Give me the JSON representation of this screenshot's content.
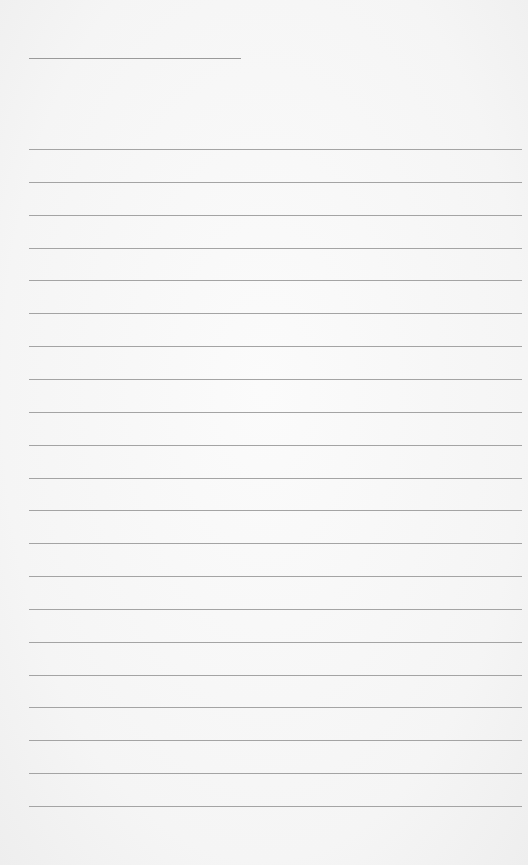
{
  "page": {
    "type": "lined-paper",
    "background_color": "#f6f6f6",
    "line_color": "#a4a4a4"
  },
  "title_line": {
    "left": 29,
    "top": 58,
    "width": 212
  },
  "ruled_lines": {
    "count": 21,
    "left": 29,
    "width": 493,
    "first_top": 149,
    "spacing": 32.85
  }
}
